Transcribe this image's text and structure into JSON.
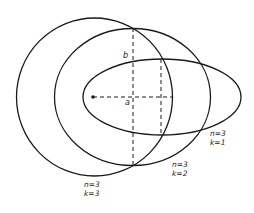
{
  "diagram": {
    "type": "bohr-sommerfeld-orbits",
    "nucleus": {
      "cx": 93,
      "cy": 97,
      "r": 1.8
    },
    "orbits": [
      {
        "id": "k3",
        "n_label": "n=3",
        "k_label": "k=3",
        "shape": "circle",
        "cx": 94.5,
        "cy": 97,
        "rx": 78,
        "ry": 79,
        "label_x": 84,
        "label_y": 180
      },
      {
        "id": "k2",
        "n_label": "n=3",
        "k_label": "k=2",
        "shape": "ellipse",
        "cx": 132.5,
        "cy": 97,
        "rx": 78,
        "ry": 68.5,
        "label_x": 172,
        "label_y": 160
      },
      {
        "id": "k1",
        "n_label": "n=3",
        "k_label": "k=1",
        "shape": "ellipse",
        "cx": 162,
        "cy": 97,
        "rx": 79,
        "ry": 38,
        "label_x": 210,
        "label_y": 129
      }
    ],
    "axes": {
      "semi_major_label": "a",
      "semi_minor_label": "b",
      "horizontal_dash": {
        "x1": 93,
        "y1": 97,
        "x2": 172,
        "y2": 97
      },
      "vertical_dash_1": {
        "x1": 133,
        "y1": 28,
        "x2": 133,
        "y2": 165
      },
      "vertical_dash_2": {
        "x1": 161,
        "y1": 59,
        "x2": 161,
        "y2": 135
      },
      "a_label_pos": {
        "x": 125,
        "y": 98
      },
      "b_label_pos": {
        "x": 123,
        "y": 51
      }
    },
    "colors": {
      "stroke": "#1a1a1a",
      "background": "#ffffff"
    }
  }
}
